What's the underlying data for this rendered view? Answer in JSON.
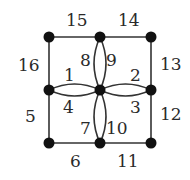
{
  "diagram": {
    "type": "graph",
    "colors": {
      "edge": "#333333",
      "node": "#111111",
      "label": "#2a2a2a",
      "background": "#ffffff"
    },
    "nodes": [
      {
        "id": "TL",
        "x": 49,
        "y": 37
      },
      {
        "id": "TM",
        "x": 100,
        "y": 37
      },
      {
        "id": "TR",
        "x": 151,
        "y": 37
      },
      {
        "id": "ML",
        "x": 49,
        "y": 90
      },
      {
        "id": "C",
        "x": 100,
        "y": 90
      },
      {
        "id": "MR",
        "x": 151,
        "y": 90
      },
      {
        "id": "BL",
        "x": 49,
        "y": 143
      },
      {
        "id": "BM",
        "x": 100,
        "y": 143
      },
      {
        "id": "BR",
        "x": 151,
        "y": 143
      }
    ],
    "labels": {
      "l1": "1",
      "l2": "2",
      "l3": "3",
      "l4": "4",
      "l5": "5",
      "l6": "6",
      "l7": "7",
      "l8": "8",
      "l9": "9",
      "l10": "10",
      "l11": "11",
      "l12": "12",
      "l13": "13",
      "l14": "14",
      "l15": "15",
      "l16": "16"
    },
    "edges": [
      {
        "label": "1",
        "from": "ML",
        "to": "C",
        "kind": "upper-arc"
      },
      {
        "label": "4",
        "from": "ML",
        "to": "C",
        "kind": "lower-arc"
      },
      {
        "label": "2",
        "from": "C",
        "to": "MR",
        "kind": "upper-arc"
      },
      {
        "label": "3",
        "from": "C",
        "to": "MR",
        "kind": "lower-arc"
      },
      {
        "label": "8",
        "from": "TM",
        "to": "C",
        "kind": "left-arc"
      },
      {
        "label": "9",
        "from": "TM",
        "to": "C",
        "kind": "right-arc"
      },
      {
        "label": "7",
        "from": "C",
        "to": "BM",
        "kind": "left-arc"
      },
      {
        "label": "10",
        "from": "C",
        "to": "BM",
        "kind": "right-arc"
      },
      {
        "label": "15",
        "from": "TL",
        "to": "TM",
        "kind": "straight"
      },
      {
        "label": "14",
        "from": "TM",
        "to": "TR",
        "kind": "straight"
      },
      {
        "label": "13",
        "from": "TR",
        "to": "MR",
        "kind": "straight"
      },
      {
        "label": "12",
        "from": "MR",
        "to": "BR",
        "kind": "straight"
      },
      {
        "label": "11",
        "from": "BM",
        "to": "BR",
        "kind": "straight"
      },
      {
        "label": "6",
        "from": "BL",
        "to": "BM",
        "kind": "straight"
      },
      {
        "label": "5",
        "from": "ML",
        "to": "BL",
        "kind": "straight"
      },
      {
        "label": "16",
        "from": "TL",
        "to": "ML",
        "kind": "straight"
      }
    ]
  }
}
